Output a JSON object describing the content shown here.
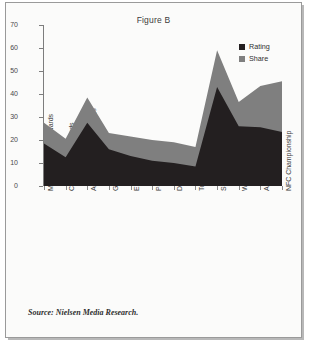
{
  "figure": {
    "title": "Figure B",
    "source": "Source: Nielsen Media Research."
  },
  "legend": {
    "position": "top-right",
    "items": [
      {
        "label": "Rating",
        "color": "#231f20",
        "name": "rating"
      },
      {
        "label": "Share",
        "color": "#7f7f7f",
        "name": "share"
      }
    ]
  },
  "axes": {
    "y_label": "Nationally Televised Events",
    "y_ticks": [
      0,
      10,
      20,
      30,
      40,
      50,
      60,
      70
    ]
  },
  "chart_data": {
    "type": "area",
    "title": "Figure B",
    "xlabel": "",
    "ylabel": "Nationally Televised Events",
    "ylim": [
      0,
      70
    ],
    "grid": false,
    "legend_position": "top-right",
    "stacked": false,
    "categories": [
      "MUSIC: Grammy Awards",
      "Country Music Awards",
      "ACTING: Academy Awards",
      "Golden Globes",
      "Emmy Awards",
      "People's Choice",
      "Daytime Emmy",
      "Tony Awards",
      "SPORTS: Super Bowl",
      "World Series Game 7",
      "AFC Championship",
      "NFC Championship"
    ],
    "series": [
      {
        "name": "Share",
        "color": "#7f7f7f",
        "values": [
          27.5,
          20.5,
          38.5,
          23.0,
          21.5,
          20.0,
          19.0,
          17.0,
          59.0,
          36.5,
          43.5,
          45.5
        ]
      },
      {
        "name": "Rating",
        "color": "#231f20",
        "values": [
          18.5,
          12.5,
          27.5,
          16.0,
          13.0,
          11.0,
          10.0,
          8.5,
          43.0,
          26.0,
          25.5,
          23.5
        ]
      }
    ],
    "source": "Source: Nielsen Media Research."
  }
}
